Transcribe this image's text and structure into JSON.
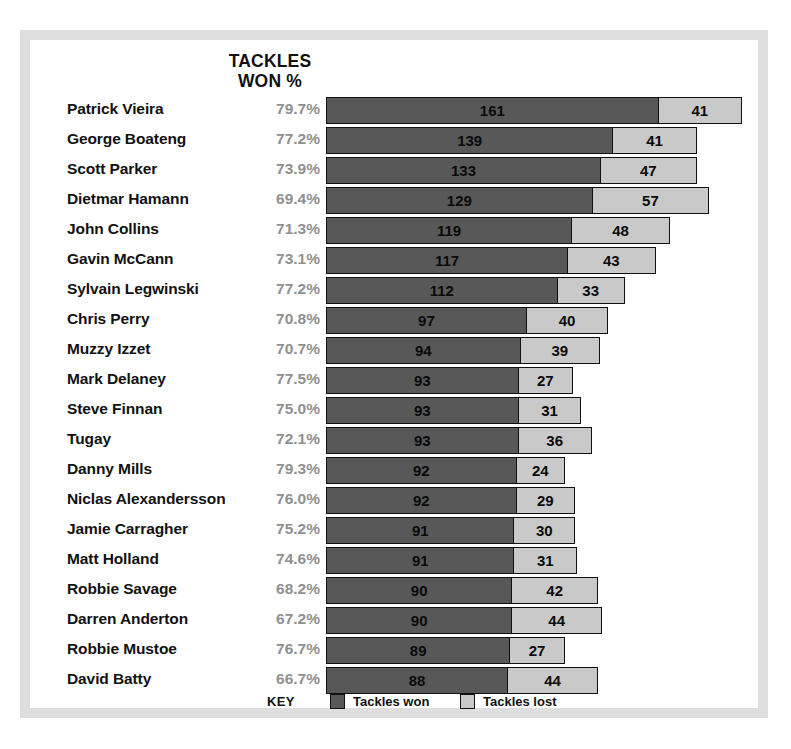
{
  "header": {
    "line1": "TACKLES",
    "line2": "WON %"
  },
  "legend": {
    "key_label": "KEY",
    "won_label": "Tackles won",
    "lost_label": "Tackles lost"
  },
  "colors": {
    "won": "#585858",
    "lost": "#c9c9c9",
    "percent_text": "#909090",
    "frame": "#dedede",
    "text": "#111111"
  },
  "chart_data": {
    "type": "bar",
    "title": "TACKLES WON %",
    "orientation": "horizontal",
    "stacked": true,
    "xlabel": "",
    "ylabel": "",
    "grid": false,
    "legend_position": "bottom",
    "px_per_unit": 2.06,
    "categories": [
      "Patrick Vieira",
      "George Boateng",
      "Scott Parker",
      "Dietmar Hamann",
      "John Collins",
      "Gavin McCann",
      "Sylvain Legwinski",
      "Chris Perry",
      "Muzzy Izzet",
      "Mark Delaney",
      "Steve Finnan",
      "Tugay",
      "Danny Mills",
      "Niclas Alexandersson",
      "Jamie Carragher",
      "Matt Holland",
      "Robbie Savage",
      "Darren Anderton",
      "Robbie Mustoe",
      "David Batty"
    ],
    "series": [
      {
        "name": "Tackles won",
        "values": [
          161,
          139,
          133,
          129,
          119,
          117,
          112,
          97,
          94,
          93,
          93,
          93,
          92,
          92,
          91,
          91,
          90,
          90,
          89,
          88
        ]
      },
      {
        "name": "Tackles lost",
        "values": [
          41,
          41,
          47,
          57,
          48,
          43,
          33,
          40,
          39,
          27,
          31,
          36,
          24,
          29,
          30,
          31,
          42,
          44,
          27,
          44
        ]
      }
    ],
    "percent_labels": [
      "79.7%",
      "77.2%",
      "73.9%",
      "69.4%",
      "71.3%",
      "73.1%",
      "77.2%",
      "70.8%",
      "70.7%",
      "77.5%",
      "75.0%",
      "72.1%",
      "79.3%",
      "76.0%",
      "75.2%",
      "74.6%",
      "68.2%",
      "67.2%",
      "76.7%",
      "66.7%"
    ]
  }
}
